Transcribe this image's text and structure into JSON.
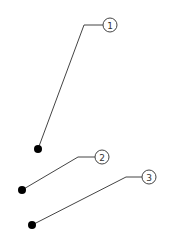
{
  "colors": {
    "background": "#ffffff",
    "leader": "#444444",
    "balloon_stroke": "#444444",
    "dot": "#000000"
  },
  "callouts": [
    {
      "label": "1",
      "balloon": {
        "cx": 110,
        "cy": 25,
        "r": 7
      },
      "elbow": {
        "x": 84,
        "y": 25
      },
      "dot": {
        "x": 38,
        "y": 149
      }
    },
    {
      "label": "2",
      "balloon": {
        "cx": 102,
        "cy": 157,
        "r": 7
      },
      "elbow": {
        "x": 78,
        "y": 157
      },
      "dot": {
        "x": 22,
        "y": 190
      }
    },
    {
      "label": "3",
      "balloon": {
        "cx": 149,
        "cy": 177,
        "r": 7
      },
      "elbow": {
        "x": 126,
        "y": 177
      },
      "dot": {
        "x": 32,
        "y": 225
      }
    }
  ]
}
